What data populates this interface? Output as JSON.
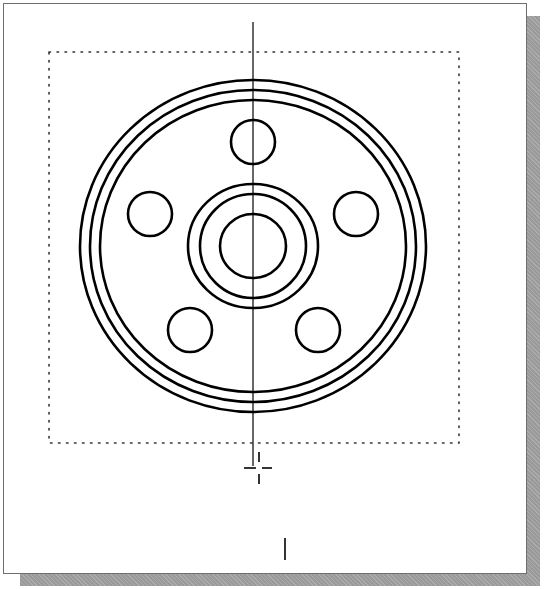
{
  "viewport": {
    "title": "CAD drawing viewport",
    "background": "#ffffff",
    "border_color": "#6e6e6e",
    "shadow_color": "#9a9a9a"
  },
  "drawing": {
    "line_color": "#000000",
    "center": {
      "x": 253,
      "y": 246
    },
    "limits_box": {
      "x1": 49,
      "y1": 52,
      "x2": 459,
      "y2": 443,
      "style": "dotted",
      "color": "#333333"
    },
    "centerline": {
      "x": 253,
      "y1": 22,
      "y2": 466
    },
    "outer_rings": [
      {
        "name": "outer-rim-outer",
        "rx": 173,
        "ry": 166
      },
      {
        "name": "outer-rim-middle",
        "rx": 163,
        "ry": 156
      },
      {
        "name": "outer-rim-inner",
        "rx": 153,
        "ry": 146
      }
    ],
    "hub_rings": [
      {
        "name": "hub-outer",
        "rx": 65,
        "ry": 62
      },
      {
        "name": "hub-inner",
        "rx": 53,
        "ry": 52
      },
      {
        "name": "bore",
        "rx": 33,
        "ry": 32
      }
    ],
    "bolt_holes": [
      {
        "name": "bolt-hole-top",
        "cx": 253,
        "cy": 142,
        "r": 22
      },
      {
        "name": "bolt-hole-left",
        "cx": 150,
        "cy": 214,
        "r": 22
      },
      {
        "name": "bolt-hole-right",
        "cx": 356,
        "cy": 214,
        "r": 22
      },
      {
        "name": "bolt-hole-bottom-left",
        "cx": 190,
        "cy": 330,
        "r": 22
      },
      {
        "name": "bolt-hole-bottom-right",
        "cx": 318,
        "cy": 330,
        "r": 22
      }
    ],
    "bolt_hole_count": 5
  },
  "cursor": {
    "type": "crosshair",
    "x": 259,
    "y": 474,
    "text_cursor_x": 285,
    "text_cursor_y1": 538,
    "text_cursor_y2": 560
  }
}
